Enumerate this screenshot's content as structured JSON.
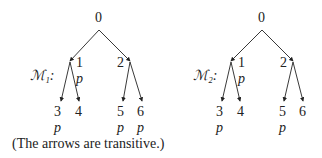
{
  "models": [
    {
      "label": "ℳ₁:",
      "nodes": {
        "root": "0",
        "n1": "1",
        "n2": "2",
        "l3": "3",
        "l4": "4",
        "l5": "5",
        "l6": "6"
      },
      "props": {
        "n1": "p",
        "l3": "p",
        "l5": "p",
        "l6": "p"
      }
    },
    {
      "label": "ℳ₂:",
      "nodes": {
        "root": "0",
        "n1": "1",
        "n2": "2",
        "l3": "3",
        "l4": "4",
        "l5": "5",
        "l6": "6"
      },
      "props": {
        "n1": "p",
        "l3": "p",
        "l5": "p"
      }
    }
  ],
  "caption": "(The arrows are transitive.)"
}
